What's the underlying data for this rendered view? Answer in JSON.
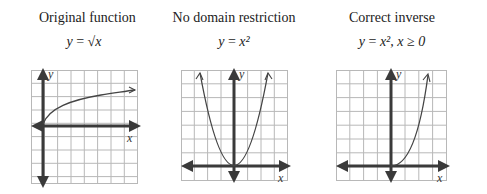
{
  "panels": [
    {
      "title": "Original function",
      "equation": "y = √x",
      "eq_parts": {
        "lhs": "y",
        "op": "=",
        "rhs": "√x"
      },
      "x_label": "x",
      "y_label": "y",
      "curve": "square-root"
    },
    {
      "title": "No domain restriction",
      "equation": "y = x²",
      "eq_parts": {
        "lhs": "y",
        "op": "=",
        "rhs": "x²"
      },
      "x_label": "x",
      "y_label": "y",
      "curve": "parabola"
    },
    {
      "title": "Correct inverse",
      "equation": "y = x², x ≥ 0",
      "eq_parts": {
        "lhs": "y",
        "op": "=",
        "rhs": "x², x ≥ 0"
      },
      "x_label": "x",
      "y_label": "y",
      "curve": "half-parabola"
    }
  ],
  "colors": {
    "grid": "#b8b8b8",
    "axis": "#3a3a3a",
    "curve": "#444444"
  }
}
